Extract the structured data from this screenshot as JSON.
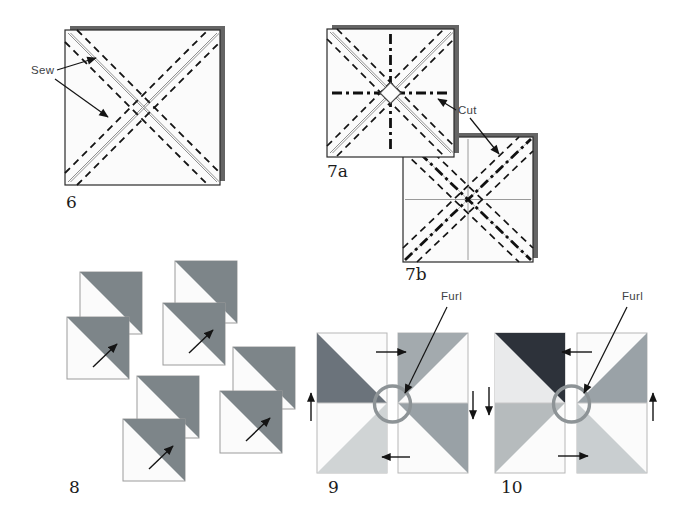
{
  "figure": {
    "labels": {
      "sew": "Sew",
      "cut": "Cut",
      "furl_9": "Furl",
      "furl_10": "Furl"
    },
    "numbers": {
      "n6": "6",
      "n7a": "7a",
      "n7b": "7b",
      "n8": "8",
      "n9": "9",
      "n10": "10"
    }
  },
  "icons": {
    "leader_arrow": "thin-black-arrow",
    "press_arrow": "thin-black-arrow",
    "furl_ring": "gray-circle-outline"
  },
  "colors": {
    "paper": "#fbfbfb",
    "shadow": "#656565",
    "hst_dark": "#7d8589",
    "pin9_tl": "#6b737b",
    "pin9_tr": "#a3aaae",
    "pin9_br": "#99a1a6",
    "pin9_bl": "#d0d4d5",
    "pin10_tl": "#2d323a",
    "pin10_pale": "#e9eaeb",
    "pin10_bl": "#b6bbbd",
    "pin10_tr": "#9aa2a7",
    "pin10_br": "#c9ced0",
    "furl_circle": "#8d9396"
  }
}
